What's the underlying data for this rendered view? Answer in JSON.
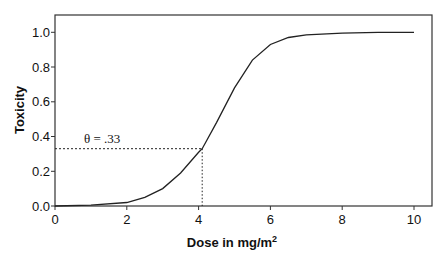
{
  "chart_data": {
    "type": "line",
    "title": "",
    "xlabel": "Dose in mg/m",
    "xlabel_superscript": "2",
    "ylabel": "Toxicity",
    "xlim": [
      0,
      10.5
    ],
    "ylim": [
      0,
      1.1
    ],
    "grid": false,
    "legend": null,
    "x_ticks": [
      "0",
      "2",
      "4",
      "6",
      "8",
      "10"
    ],
    "y_ticks": [
      "0.0",
      "0.2",
      "0.4",
      "0.6",
      "0.8",
      "1.0"
    ],
    "series": [
      {
        "name": "dose-toxicity curve",
        "x": [
          0,
          1,
          2,
          2.5,
          3,
          3.5,
          4,
          4.1,
          4.5,
          5,
          5.5,
          6,
          6.5,
          7,
          8,
          9,
          10
        ],
        "y": [
          0.0,
          0.005,
          0.02,
          0.05,
          0.1,
          0.19,
          0.31,
          0.33,
          0.48,
          0.68,
          0.84,
          0.93,
          0.97,
          0.985,
          0.995,
          1.0,
          1.0
        ]
      }
    ],
    "annotations": [
      {
        "text": "θ = .33",
        "type": "threshold",
        "y": 0.33,
        "x_at_curve": 4.1,
        "style": "dashed reference lines"
      }
    ]
  }
}
